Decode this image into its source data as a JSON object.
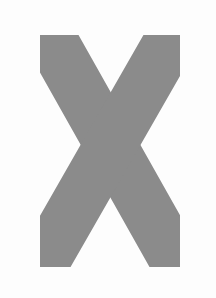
{
  "canvas": {
    "width": 216,
    "height": 298,
    "background_color": "#fdfdfd"
  },
  "glyph": {
    "character": "X",
    "name": "letter-x",
    "description": "Uppercase letter X formed by two crossing thick round-capped diagonal strokes",
    "fill_color": "#8b8b8b",
    "fill_texture": "halftone-dither",
    "stroke_width": 52,
    "cap_style": "round",
    "crossing_center": {
      "x": 108,
      "y": 150
    },
    "strokes": [
      {
        "name": "stroke-nw-se",
        "x1": 56,
        "y1": 48,
        "x2": 172,
        "y2": 254
      },
      {
        "name": "stroke-ne-sw",
        "x1": 166,
        "y1": 48,
        "x2": 48,
        "y2": 254
      }
    ]
  }
}
